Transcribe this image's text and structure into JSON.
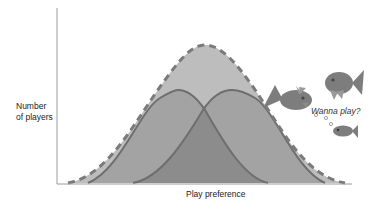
{
  "labels": {
    "ylabel_line1": "Number",
    "ylabel_line2": "of players",
    "xlabel": "Play preference",
    "speech": "Wanna play?"
  },
  "colors": {
    "outer_fill": "#bdbdbd",
    "outer_dash": "#7a7a7a",
    "left_fill": "#9e9e9e",
    "right_fill": "#9e9e9e",
    "overlap_fill": "#8a8a8a",
    "curve_stroke": "#6e6e6e",
    "axis": "#9a9a9a",
    "fish": "#7d7d7d"
  },
  "curves": {
    "outer": {
      "style": "dashed",
      "peak_x": 205,
      "peak_y": 45
    },
    "left": {
      "style": "solid",
      "peak_x": 177,
      "peak_y": 90
    },
    "right": {
      "style": "solid",
      "peak_x": 232,
      "peak_y": 90
    }
  },
  "icons": [
    "fish-icon-large-left",
    "fish-icon-large-right",
    "fish-icon-small",
    "bubble-icon"
  ]
}
